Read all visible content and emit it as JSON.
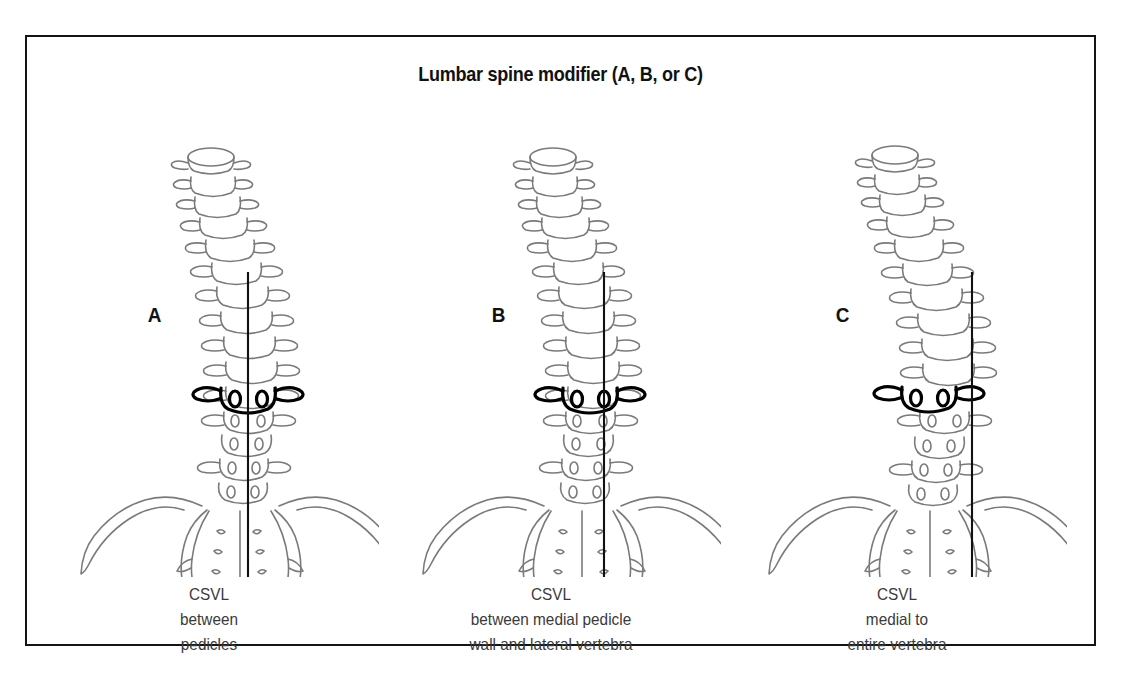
{
  "figure": {
    "title": "Lumbar spine modifier (A, B, or C)",
    "border_color": "#141414",
    "background": "#ffffff"
  },
  "style": {
    "bone_stroke": "#7a7a7a",
    "apical_stroke": "#000000",
    "csvl_color": "#111111"
  },
  "panels": [
    {
      "letter": "A",
      "caption_line1": "CSVL",
      "caption_line2": "between",
      "caption_line3": "pedicles",
      "csvl_relation": "between pedicles"
    },
    {
      "letter": "B",
      "caption_line1": "CSVL",
      "caption_line2": "between medial pedicle",
      "caption_line3": "wall and lateral vertebra",
      "csvl_relation": "between medial pedicle wall and lateral vertebra"
    },
    {
      "letter": "C",
      "caption_line1": "CSVL",
      "caption_line2": "medial to",
      "caption_line3": "entire vertebra",
      "csvl_relation": "medial to entire vertebra"
    }
  ]
}
